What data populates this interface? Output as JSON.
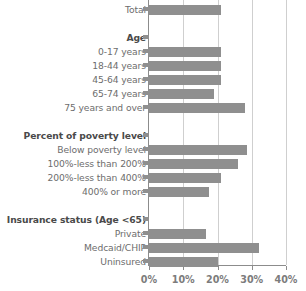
{
  "chart_data": {
    "type": "bar",
    "orientation": "horizontal",
    "title": "",
    "xlabel": "",
    "ylabel": "",
    "xlim": [
      0,
      40
    ],
    "grid": true,
    "legend": false,
    "xticks": [
      "0%",
      "10%",
      "20%",
      "30%",
      "40%"
    ],
    "xtick_values": [
      0,
      10,
      20,
      30,
      40
    ],
    "categories": [
      "Total",
      "Age",
      "0-17 years",
      "18-44 years",
      "45-64 years",
      "65-74 years",
      "75 years and over",
      "Percent of poverty level",
      "Below poverty level",
      "100%-less than 200%",
      "200%-less than 400%",
      "400% or more",
      "Insurance status (Age <65)",
      "Private",
      "Medcaid/CHIP",
      "Uninsured"
    ],
    "values": [
      21.0,
      null,
      21.0,
      21.0,
      21.0,
      19.0,
      28.0,
      null,
      28.5,
      26.0,
      21.0,
      17.5,
      null,
      16.5,
      32.0,
      20.0
    ],
    "bar_color": "#8f8f8f"
  },
  "rows": [
    {
      "label": "Total",
      "value": 21.0,
      "header": false,
      "spacer_before": 0
    },
    {
      "label": "Age",
      "value": null,
      "header": true,
      "spacer_before": 1
    },
    {
      "label": "0-17 years",
      "value": 21.0,
      "header": false,
      "spacer_before": 0
    },
    {
      "label": "18-44 years",
      "value": 21.0,
      "header": false,
      "spacer_before": 0
    },
    {
      "label": "45-64 years",
      "value": 21.0,
      "header": false,
      "spacer_before": 0
    },
    {
      "label": "65-74 years",
      "value": 19.0,
      "header": false,
      "spacer_before": 0
    },
    {
      "label": "75 years and over",
      "value": 28.0,
      "header": false,
      "spacer_before": 0
    },
    {
      "label": "Percent of poverty level",
      "value": null,
      "header": true,
      "spacer_before": 1
    },
    {
      "label": "Below poverty level",
      "value": 28.5,
      "header": false,
      "spacer_before": 0
    },
    {
      "label": "100%-less than 200%",
      "value": 26.0,
      "header": false,
      "spacer_before": 0
    },
    {
      "label": "200%-less than 400%",
      "value": 21.0,
      "header": false,
      "spacer_before": 0
    },
    {
      "label": "400% or more",
      "value": 17.5,
      "header": false,
      "spacer_before": 0
    },
    {
      "label": "Insurance status (Age <65)",
      "value": null,
      "header": true,
      "spacer_before": 1
    },
    {
      "label": "Private",
      "value": 16.5,
      "header": false,
      "spacer_before": 0
    },
    {
      "label": "Medcaid/CHIP",
      "value": 32.0,
      "header": false,
      "spacer_before": 0
    },
    {
      "label": "Uninsured",
      "value": 20.0,
      "header": false,
      "spacer_before": 0
    }
  ],
  "axis": {
    "tick_labels": [
      "0%",
      "10%",
      "20%",
      "30%",
      "40%"
    ],
    "tick_values": [
      0,
      10,
      20,
      30,
      40
    ],
    "max": 40
  },
  "colors": {
    "bar": "#8f8f8f",
    "grid": "#cfcfcf",
    "axis": "#8c8c8c",
    "label": "#6d6d6d",
    "header_label": "#4a4a4a",
    "tick_label": "#7c7c7c"
  }
}
